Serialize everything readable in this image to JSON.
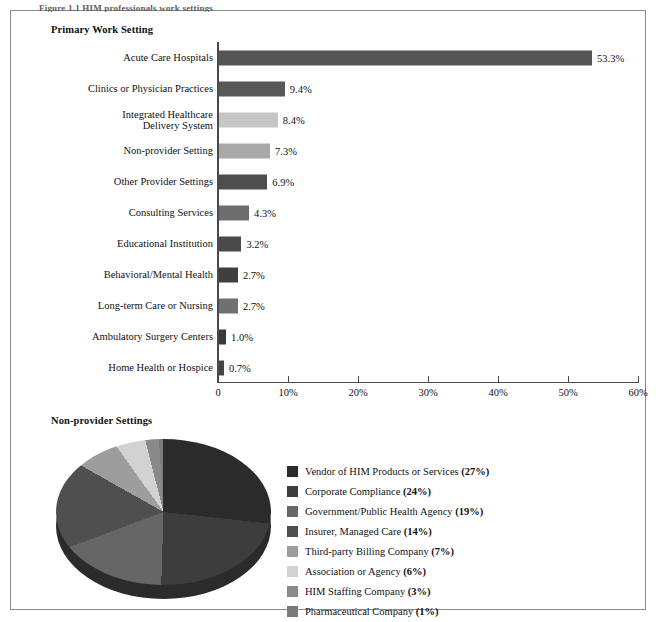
{
  "figure": {
    "caption": "Figure 1.1   HIM professionals work settings",
    "frame_border_color": "#8a8a8a"
  },
  "bar_section": {
    "title": "Primary Work Setting"
  },
  "pie_section": {
    "title": "Non-provider Settings"
  },
  "chart_data": [
    {
      "type": "bar",
      "title": "Primary Work Setting",
      "orientation": "horizontal",
      "xlabel": "",
      "ylabel": "",
      "xlim": [
        0,
        60
      ],
      "grid": false,
      "categories": [
        "Acute Care Hospitals",
        "Clinics or Physician Practices",
        "Integrated Healthcare Delivery System",
        "Non-provider Setting",
        "Other Provider Settings",
        "Consulting Services",
        "Educational Institution",
        "Behavioral/Mental Health",
        "Long-term Care or Nursing",
        "Ambulatory Surgery Centers",
        "Home Health or Hospice"
      ],
      "category_lines": [
        [
          "Acute Care Hospitals"
        ],
        [
          "Clinics or Physician Practices"
        ],
        [
          "Integrated Healthcare",
          "Delivery System"
        ],
        [
          "Non-provider Setting"
        ],
        [
          "Other Provider Settings"
        ],
        [
          "Consulting Services"
        ],
        [
          "Educational Institution"
        ],
        [
          "Behavioral/Mental Health"
        ],
        [
          "Long-term Care or Nursing"
        ],
        [
          "Ambulatory Surgery Centers"
        ],
        [
          "Home Health or Hospice"
        ]
      ],
      "values": [
        53.3,
        9.4,
        8.4,
        7.3,
        6.9,
        4.3,
        3.2,
        2.7,
        2.7,
        1.0,
        0.7
      ],
      "value_labels": [
        "53.3%",
        "9.4%",
        "8.4%",
        "7.3%",
        "6.9%",
        "4.3%",
        "3.2%",
        "2.7%",
        "2.7%",
        "1.0%",
        "0.7%"
      ],
      "bar_colors": [
        "#555555",
        "#585858",
        "#c6c6c6",
        "#a8a8a8",
        "#4e4e4e",
        "#6d6d6d",
        "#4a4a4a",
        "#3f3f3f",
        "#707070",
        "#3a3a3a",
        "#444444"
      ],
      "xticks": [
        0,
        10,
        20,
        30,
        40,
        50,
        60
      ],
      "xtick_labels": [
        "0",
        "10%",
        "20%",
        "30%",
        "40%",
        "50%",
        "60%"
      ]
    },
    {
      "type": "pie",
      "title": "Non-provider Settings",
      "legend_position": "right",
      "labels": [
        "Vendor of HIM Products or Services",
        "Corporate Compliance",
        "Government/Public Health Agency",
        "Insurer, Managed Care",
        "Third-party Billing Company",
        "Association or Agency",
        "HIM Staffing Company",
        "Pharmaceutical Company"
      ],
      "values": [
        27,
        24,
        19,
        14,
        7,
        6,
        3,
        1
      ],
      "value_labels": [
        "(27%)",
        "(24%)",
        "(19%)",
        "(14%)",
        "(7%)",
        "(6%)",
        "(3%)",
        "(1%)"
      ],
      "colors": [
        "#2b2b2b",
        "#3d3d3d",
        "#666666",
        "#4f4f4f",
        "#9d9d9d",
        "#d2d2d2",
        "#8a8a8a",
        "#7a7a7a"
      ],
      "legend_entries": [
        {
          "label": "Vendor of HIM Products or Services",
          "value": "(27%)",
          "color": "#2b2b2b"
        },
        {
          "label": "Corporate Compliance",
          "value": "(24%)",
          "color": "#3d3d3d"
        },
        {
          "label": "Government/Public Health Agency",
          "value": "(19%)",
          "color": "#666666"
        },
        {
          "label": "Insurer, Managed Care",
          "value": "(14%)",
          "color": "#4f4f4f"
        },
        {
          "label": "Third-party Billing Company",
          "value": "(7%)",
          "color": "#9d9d9d"
        },
        {
          "label": "Association or Agency",
          "value": "(6%)",
          "color": "#d2d2d2"
        },
        {
          "label": "HIM Staffing Company",
          "value": "(3%)",
          "color": "#8a8a8a"
        },
        {
          "label": "Pharmaceutical Company",
          "value": "(1%)",
          "color": "#7a7a7a"
        }
      ]
    }
  ]
}
